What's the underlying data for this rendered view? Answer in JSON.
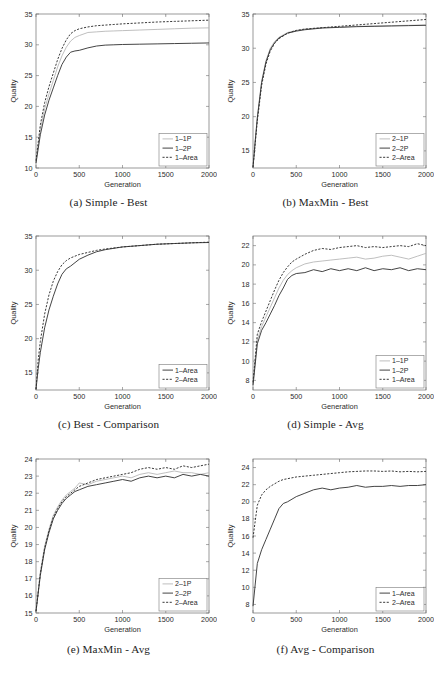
{
  "page": {
    "kind": "figure-panel",
    "panel_count": 6,
    "shared_xlabel": "Generation",
    "shared_ylabel": "Quality",
    "xticks": [
      0,
      500,
      1000,
      1500,
      2000
    ]
  },
  "chart_data": [
    {
      "id": "a",
      "type": "line",
      "caption": "(a) Simple - Best",
      "title": "Simple - Best",
      "xlabel": "Generation",
      "ylabel": "Quality",
      "xlim": [
        0,
        2000
      ],
      "ylim": [
        10,
        35
      ],
      "xticks": [
        0,
        500,
        1000,
        1500,
        2000
      ],
      "yticks": [
        10,
        15,
        20,
        25,
        30,
        35
      ],
      "grid": false,
      "legend_position": "lower-right",
      "x": [
        0,
        50,
        100,
        150,
        200,
        250,
        300,
        350,
        400,
        450,
        500,
        600,
        700,
        800,
        900,
        1000,
        1200,
        1400,
        1600,
        1800,
        2000
      ],
      "series": [
        {
          "name": "1–1P",
          "style": "solid-light",
          "values": [
            11.0,
            16.2,
            19.6,
            22.0,
            24.2,
            26.4,
            28.2,
            29.6,
            30.6,
            31.2,
            31.5,
            32.0,
            32.1,
            32.2,
            32.25,
            32.3,
            32.4,
            32.5,
            32.6,
            32.7,
            32.75
          ]
        },
        {
          "name": "1–2P",
          "style": "solid-dark",
          "values": [
            10.8,
            15.4,
            18.6,
            21.0,
            23.0,
            25.0,
            26.8,
            28.0,
            28.8,
            29.0,
            29.1,
            29.5,
            29.8,
            29.95,
            30.0,
            30.05,
            30.1,
            30.15,
            30.2,
            30.25,
            30.3
          ]
        },
        {
          "name": "1–Area",
          "style": "dotted",
          "values": [
            11.2,
            17.0,
            20.6,
            23.2,
            25.4,
            27.6,
            29.4,
            30.8,
            31.8,
            32.3,
            32.6,
            32.9,
            33.1,
            33.2,
            33.3,
            33.4,
            33.55,
            33.7,
            33.8,
            33.9,
            34.0
          ]
        }
      ]
    },
    {
      "id": "b",
      "type": "line",
      "caption": "(b) MaxMin - Best",
      "title": "MaxMin - Best",
      "xlabel": "Generation",
      "ylabel": "Quality",
      "xlim": [
        0,
        2000
      ],
      "ylim": [
        12.5,
        35
      ],
      "xticks": [
        0,
        500,
        1000,
        1500,
        2000
      ],
      "yticks": [
        15,
        20,
        25,
        30,
        35
      ],
      "grid": false,
      "legend_position": "lower-right",
      "x": [
        0,
        25,
        50,
        100,
        150,
        200,
        250,
        300,
        400,
        500,
        600,
        800,
        1000,
        1200,
        1400,
        1600,
        1800,
        2000
      ],
      "series": [
        {
          "name": "2–1P",
          "style": "solid-light",
          "values": [
            12.6,
            16.5,
            20.0,
            25.2,
            28.2,
            30.0,
            31.0,
            31.6,
            32.3,
            32.6,
            32.8,
            33.0,
            33.1,
            33.2,
            33.25,
            33.3,
            33.35,
            33.4
          ]
        },
        {
          "name": "2–2P",
          "style": "solid-dark",
          "values": [
            12.6,
            16.3,
            19.8,
            25.0,
            28.0,
            29.8,
            30.8,
            31.5,
            32.2,
            32.5,
            32.7,
            32.95,
            33.05,
            33.15,
            33.2,
            33.25,
            33.3,
            33.35
          ]
        },
        {
          "name": "2–Area",
          "style": "dotted",
          "values": [
            12.6,
            16.0,
            19.4,
            24.6,
            27.7,
            29.6,
            30.7,
            31.4,
            32.2,
            32.6,
            32.8,
            33.0,
            33.2,
            33.4,
            33.6,
            33.8,
            34.0,
            34.2
          ]
        }
      ]
    },
    {
      "id": "c",
      "type": "line",
      "caption": "(c) Best - Comparison",
      "title": "Best - Comparison",
      "xlabel": "Generation",
      "ylabel": "Quality",
      "xlim": [
        0,
        2000
      ],
      "ylim": [
        12.5,
        35
      ],
      "xticks": [
        0,
        500,
        1000,
        1500,
        2000
      ],
      "yticks": [
        15,
        20,
        25,
        30,
        35
      ],
      "grid": false,
      "legend_position": "lower-right",
      "x": [
        0,
        25,
        50,
        100,
        150,
        200,
        250,
        300,
        350,
        400,
        500,
        600,
        700,
        800,
        1000,
        1200,
        1400,
        1600,
        1800,
        2000
      ],
      "series": [
        {
          "name": "1–Area",
          "style": "solid-dark",
          "values": [
            12.6,
            15.6,
            18.0,
            21.6,
            24.2,
            26.2,
            28.0,
            29.4,
            30.2,
            30.6,
            31.6,
            32.2,
            32.7,
            33.0,
            33.4,
            33.6,
            33.8,
            33.9,
            34.0,
            34.05
          ]
        },
        {
          "name": "2–Area",
          "style": "dotted",
          "values": [
            12.6,
            16.8,
            19.6,
            23.6,
            26.4,
            28.4,
            29.8,
            30.8,
            31.4,
            31.8,
            32.3,
            32.6,
            32.9,
            33.1,
            33.4,
            33.6,
            33.8,
            33.9,
            34.0,
            34.1
          ]
        }
      ]
    },
    {
      "id": "d",
      "type": "line",
      "caption": "(d) Simple - Avg",
      "title": "Simple - Avg",
      "xlabel": "Generation",
      "ylabel": "Quality",
      "xlim": [
        0,
        2000
      ],
      "ylim": [
        7,
        23
      ],
      "xticks": [
        0,
        500,
        1000,
        1500,
        2000
      ],
      "yticks": [
        8,
        10,
        12,
        14,
        16,
        18,
        20,
        22
      ],
      "grid": false,
      "legend_position": "lower-right",
      "x": [
        0,
        50,
        100,
        150,
        200,
        250,
        300,
        350,
        400,
        450,
        500,
        600,
        700,
        800,
        900,
        1000,
        1100,
        1200,
        1300,
        1400,
        1500,
        1600,
        1700,
        1800,
        1900,
        2000
      ],
      "series": [
        {
          "name": "1–1P",
          "style": "solid-light",
          "values": [
            7.6,
            12.2,
            13.6,
            14.6,
            15.6,
            16.6,
            17.6,
            18.4,
            19.0,
            19.4,
            19.7,
            20.1,
            20.3,
            20.4,
            20.5,
            20.6,
            20.7,
            20.8,
            20.6,
            20.7,
            20.9,
            21.0,
            20.8,
            20.6,
            20.9,
            21.2
          ]
        },
        {
          "name": "1–2P",
          "style": "solid-dark",
          "values": [
            7.5,
            11.8,
            13.2,
            14.0,
            14.9,
            15.8,
            16.8,
            17.6,
            18.5,
            18.9,
            19.1,
            19.2,
            19.5,
            19.3,
            19.6,
            19.4,
            19.6,
            19.4,
            19.7,
            19.4,
            19.6,
            19.5,
            19.7,
            19.4,
            19.6,
            19.5
          ]
        },
        {
          "name": "1–Area",
          "style": "dotted",
          "values": [
            7.8,
            12.8,
            14.1,
            15.2,
            16.3,
            17.4,
            18.4,
            19.2,
            19.8,
            20.3,
            20.6,
            21.1,
            21.5,
            21.7,
            21.6,
            21.8,
            21.9,
            22.0,
            21.8,
            21.9,
            21.8,
            21.9,
            22.0,
            21.9,
            22.2,
            22.0
          ]
        }
      ]
    },
    {
      "id": "e",
      "type": "line",
      "caption": "(e) MaxMin - Avg",
      "title": "MaxMin - Avg",
      "xlabel": "Generation",
      "ylabel": "Quality",
      "xlim": [
        0,
        2000
      ],
      "ylim": [
        15,
        24
      ],
      "xticks": [
        0,
        500,
        1000,
        1500,
        2000
      ],
      "yticks": [
        15,
        16,
        17,
        18,
        19,
        20,
        21,
        22,
        23,
        24
      ],
      "grid": false,
      "legend_position": "lower-right",
      "x": [
        0,
        50,
        100,
        150,
        200,
        250,
        300,
        350,
        400,
        450,
        500,
        600,
        700,
        800,
        900,
        1000,
        1100,
        1200,
        1300,
        1400,
        1500,
        1600,
        1700,
        1800,
        1900,
        2000
      ],
      "series": [
        {
          "name": "2–1P",
          "style": "solid-light",
          "values": [
            15.1,
            17.4,
            18.9,
            19.9,
            20.7,
            21.2,
            21.6,
            21.9,
            22.1,
            22.3,
            22.6,
            22.5,
            22.7,
            22.8,
            22.9,
            23.0,
            22.9,
            23.1,
            23.2,
            23.1,
            23.2,
            23.3,
            23.2,
            23.2,
            23.1,
            23.2
          ]
        },
        {
          "name": "2–2P",
          "style": "solid-dark",
          "values": [
            15.1,
            17.2,
            18.7,
            19.7,
            20.5,
            21.0,
            21.4,
            21.7,
            21.9,
            22.1,
            22.2,
            22.4,
            22.5,
            22.6,
            22.7,
            22.8,
            22.7,
            22.9,
            23.0,
            22.9,
            23.0,
            22.9,
            23.1,
            23.0,
            23.1,
            23.0
          ]
        },
        {
          "name": "2–Area",
          "style": "dotted",
          "values": [
            15.1,
            17.3,
            18.8,
            19.8,
            20.6,
            21.1,
            21.5,
            21.8,
            22.0,
            22.2,
            22.4,
            22.6,
            22.8,
            22.9,
            23.0,
            23.1,
            23.2,
            23.4,
            23.5,
            23.4,
            23.5,
            23.4,
            23.6,
            23.5,
            23.6,
            23.7
          ]
        }
      ]
    },
    {
      "id": "f",
      "type": "line",
      "caption": "(f) Avg - Comparison",
      "title": "Avg - Comparison",
      "xlabel": "Generation",
      "ylabel": "Quality",
      "xlim": [
        0,
        2000
      ],
      "ylim": [
        7,
        25
      ],
      "xticks": [
        0,
        500,
        1000,
        1500,
        2000
      ],
      "yticks": [
        8,
        10,
        12,
        14,
        16,
        18,
        20,
        22,
        24
      ],
      "grid": false,
      "legend_position": "lower-right",
      "x": [
        0,
        50,
        100,
        150,
        200,
        250,
        300,
        350,
        400,
        500,
        600,
        700,
        800,
        900,
        1000,
        1100,
        1200,
        1300,
        1400,
        1500,
        1600,
        1700,
        1800,
        1900,
        2000
      ],
      "series": [
        {
          "name": "1–Area",
          "style": "solid-dark",
          "values": [
            7.8,
            12.8,
            14.4,
            15.6,
            16.8,
            18.0,
            19.2,
            19.8,
            20.0,
            20.6,
            21.0,
            21.4,
            21.6,
            21.4,
            21.6,
            21.7,
            21.9,
            21.7,
            21.8,
            21.8,
            21.9,
            21.8,
            21.9,
            21.9,
            22.0
          ]
        },
        {
          "name": "2–Area",
          "style": "dotted",
          "values": [
            15.8,
            19.6,
            20.8,
            21.4,
            21.8,
            22.1,
            22.4,
            22.6,
            22.7,
            22.9,
            23.0,
            23.1,
            23.2,
            23.3,
            23.4,
            23.5,
            23.55,
            23.6,
            23.6,
            23.55,
            23.6,
            23.5,
            23.55,
            23.5,
            23.55
          ]
        }
      ]
    }
  ]
}
